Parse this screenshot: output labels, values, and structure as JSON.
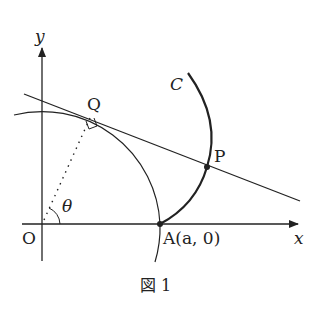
{
  "figure": {
    "caption": "図 1",
    "labels": {
      "y_axis": "y",
      "x_axis": "x",
      "origin": "O",
      "point_q": "Q",
      "point_p": "P",
      "curve_c": "C",
      "point_a": "A(a, 0)",
      "angle": "θ"
    },
    "colors": {
      "stroke": "#222222",
      "background": "#ffffff"
    }
  }
}
